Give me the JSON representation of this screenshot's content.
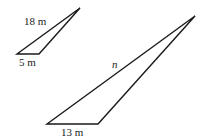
{
  "diagram": {
    "line_color": "#1a1a1a",
    "small_triangle": {
      "points": "17,54 39,54 80,8",
      "labels": {
        "hypotenuse": "18 m",
        "base": "5 m"
      }
    },
    "large_triangle": {
      "points": "47,124 98,124 195,16",
      "labels": {
        "hypotenuse": "n",
        "base": "13 m"
      }
    }
  }
}
